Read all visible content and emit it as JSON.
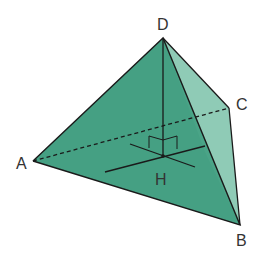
{
  "diagram": {
    "type": "tetrahedron",
    "vertices": {
      "A": {
        "label": "A",
        "x": 33,
        "y": 161
      },
      "B": {
        "label": "B",
        "x": 240,
        "y": 225
      },
      "C": {
        "label": "C",
        "x": 229,
        "y": 108
      },
      "D": {
        "label": "D",
        "x": 163,
        "y": 38
      },
      "H": {
        "label": "H",
        "x": 163,
        "y": 156
      }
    },
    "colors": {
      "face_main": "#3f9f80",
      "face_side": "#8dcbb5",
      "edge": "#1a1a1a"
    },
    "hidden_edge": "AC",
    "altitude": "DH",
    "right_angle_marker_at": "H"
  }
}
